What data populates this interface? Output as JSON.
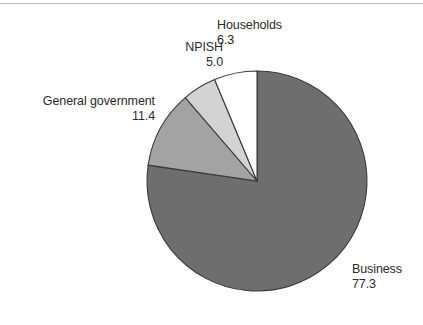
{
  "chart_data": {
    "type": "pie",
    "title": "",
    "subtitle": "",
    "xlabel": "",
    "ylabel": "",
    "grid": false,
    "legend_position": "none",
    "label_style": "outside-callout",
    "start_angle_deg": 0,
    "direction": "clockwise",
    "categories": [
      "Business",
      "Households",
      "NPISH",
      "General government"
    ],
    "values": [
      77.3,
      6.3,
      5.0,
      11.4
    ],
    "total": 100.0,
    "slices": [
      {
        "label": "Business",
        "value": "77.3",
        "value_num": 77.3,
        "color": "#6e6e6e",
        "outline": "#3a3a3a",
        "start_deg": 0,
        "sweep_deg": 278.28,
        "label_align": "left"
      },
      {
        "label": "General government",
        "value": "11.4",
        "value_num": 11.4,
        "color": "#a3a3a3",
        "outline": "#3a3a3a",
        "start_deg": 278.28,
        "sweep_deg": 41.04,
        "label_align": "right"
      },
      {
        "label": "NPISH",
        "value": "5.0",
        "value_num": 5.0,
        "color": "#d3d3d3",
        "outline": "#3a3a3a",
        "start_deg": 319.32,
        "sweep_deg": 18.0,
        "label_align": "right"
      },
      {
        "label": "Households",
        "value": "6.3",
        "value_num": 6.3,
        "color": "#ffffff",
        "outline": "#3a3a3a",
        "start_deg": 337.32,
        "sweep_deg": 22.68,
        "label_align": "left"
      }
    ]
  },
  "labels": {
    "households": {
      "name": "Households",
      "value": "6.3"
    },
    "npish": {
      "name": "NPISH",
      "value": "5.0"
    },
    "general_government": {
      "name": "General government",
      "value": "11.4"
    },
    "business": {
      "name": "Business",
      "value": "77.3"
    }
  },
  "colors": {
    "business": "#6e6e6e",
    "general_government": "#a3a3a3",
    "npish": "#d3d3d3",
    "households": "#ffffff",
    "outline": "#3a3a3a",
    "text": "#2b2b2b",
    "rule": "#b9bcc0",
    "background": "#ffffff"
  }
}
